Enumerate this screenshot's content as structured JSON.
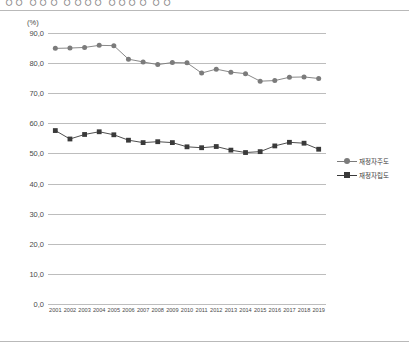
{
  "heading": {
    "text": "ㅇㅇ ㅇㅇㅇ ㅇㅇㅇㅇ ㅇㅇㅇㅇ ㅇㅇ",
    "visible": "partially-cropped"
  },
  "unit_label": "(%)",
  "legend": {
    "position": "right",
    "items": [
      {
        "label": "재정자주도",
        "marker": "circle",
        "color": "#7b7b7b"
      },
      {
        "label": "재정자립도",
        "marker": "square",
        "color": "#3a3a3a"
      }
    ]
  },
  "chart_data": {
    "type": "line",
    "title": "",
    "subtitle": "",
    "xlabel": "",
    "ylabel": "(%)",
    "ylim": [
      0.0,
      90.0
    ],
    "ytick_step": 10.0,
    "ytick_labels": [
      "90,0",
      "80,0",
      "70,0",
      "60,0",
      "50,0",
      "40,0",
      "30,0",
      "20,0",
      "10,0",
      "0,0"
    ],
    "ytick_values": [
      90.0,
      80.0,
      70.0,
      60.0,
      50.0,
      40.0,
      30.0,
      20.0,
      10.0,
      0.0
    ],
    "grid": true,
    "legend_position": "right",
    "categories": [
      "2001",
      "2002",
      "2003",
      "2004",
      "2005",
      "2006",
      "2007",
      "2008",
      "2009",
      "2010",
      "2011",
      "2012",
      "2013",
      "2014",
      "2015",
      "2016",
      "2017",
      "2018",
      "2019"
    ],
    "series": [
      {
        "name": "재정자주도",
        "marker": "circle",
        "color": "#7b7b7b",
        "values": [
          84.9,
          85.0,
          85.2,
          85.9,
          85.8,
          81.3,
          80.4,
          79.5,
          80.2,
          80.1,
          76.7,
          78.0,
          77.0,
          76.5,
          74.0,
          74.2,
          75.3,
          75.4,
          74.9
        ]
      },
      {
        "name": "재정자립도",
        "marker": "square",
        "color": "#3a3a3a",
        "values": [
          57.6,
          54.8,
          56.3,
          57.2,
          56.2,
          54.4,
          53.6,
          53.9,
          53.6,
          52.2,
          51.9,
          52.3,
          51.1,
          50.3,
          50.6,
          52.5,
          53.7,
          53.4,
          51.4
        ]
      }
    ]
  }
}
